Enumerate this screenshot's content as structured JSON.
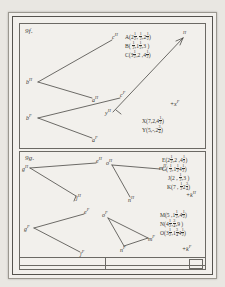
{
  "page": {
    "kind": "scanned-worksheet",
    "ink_color": "#3f3e3a",
    "paper_color": "#f2f0ec"
  },
  "problems": [
    {
      "id": "9f",
      "label": "9f.",
      "vertices": [
        {
          "name": "c-H",
          "text": "c",
          "sup": "H"
        },
        {
          "name": "b-H",
          "text": "b",
          "sup": "H"
        },
        {
          "name": "a-H",
          "text": "a",
          "sup": "H"
        },
        {
          "name": "c-F",
          "text": "c",
          "sup": "F"
        },
        {
          "name": "b-F",
          "text": "b",
          "sup": "F"
        },
        {
          "name": "a-F",
          "text": "a",
          "sup": "F"
        },
        {
          "name": "y-axis-label",
          "text": "y",
          "sup": "H"
        },
        {
          "name": "arrow-head-label",
          "text": "",
          "sup": "H"
        }
      ],
      "axis_notes": [
        {
          "name": "plus-x-f",
          "text": "+x",
          "sup": "F"
        }
      ],
      "coordinate_groups": [
        {
          "name": "abc-coords",
          "lines": [
            {
              "point": "A",
              "x": "2 1/2",
              "y": "1/2",
              "z": "2 1/2"
            },
            {
              "point": "B",
              "x": "1/2",
              "y": "1 1/2",
              "z": "3"
            },
            {
              "point": "C",
              "x": "3 1/2",
              "y": "2",
              "z": "4 1/2"
            }
          ]
        },
        {
          "name": "xy-coords",
          "lines": [
            {
              "point": "X",
              "x": "7",
              "y": "2",
              "z": "4 1/2"
            },
            {
              "point": "Y",
              "x": "5",
              "y": "-",
              "z": "2 3/4"
            }
          ]
        }
      ]
    },
    {
      "id": "9g",
      "label": "9g.",
      "vertices": [
        {
          "name": "e-H",
          "text": "e",
          "sup": "H"
        },
        {
          "name": "g-H",
          "text": "g",
          "sup": "H"
        },
        {
          "name": "j-H",
          "text": "j",
          "sup": "H"
        },
        {
          "name": "o-H",
          "text": "o",
          "sup": "H"
        },
        {
          "name": "m-H",
          "text": "m",
          "sup": "H"
        },
        {
          "name": "n-H",
          "text": "n",
          "sup": "H"
        },
        {
          "name": "e-F",
          "text": "e",
          "sup": "F"
        },
        {
          "name": "g-F",
          "text": "g",
          "sup": "F"
        },
        {
          "name": "j-F",
          "text": "j",
          "sup": "F"
        },
        {
          "name": "o-F",
          "text": "o",
          "sup": "F"
        },
        {
          "name": "m-F",
          "text": "m",
          "sup": "F"
        },
        {
          "name": "n-F",
          "text": "n",
          "sup": "F"
        }
      ],
      "axis_notes": [
        {
          "name": "plus-k-h",
          "text": "+k",
          "sup": "H"
        },
        {
          "name": "plus-k-f",
          "text": "+k",
          "sup": "F"
        }
      ],
      "coordinate_groups": [
        {
          "name": "egjk-coords",
          "lines": [
            {
              "point": "E",
              "x": "2 1/2",
              "y": "2",
              "z": "4 1/2"
            },
            {
              "point": "G",
              "x": "1/2",
              "y": "1 1/2",
              "z": "4 1/2"
            },
            {
              "point": "J",
              "x": "2",
              "y": "1/2",
              "z": "3"
            },
            {
              "point": "K",
              "x": "7",
              "y": "1/2",
              "z": "2 3/4"
            }
          ]
        },
        {
          "name": "mno-coords",
          "lines": [
            {
              "point": "M",
              "x": "5",
              "y": "1 1/2",
              "z": "4 1/2"
            },
            {
              "point": "N",
              "x": "4 1/2",
              "y": "3/4",
              "z": "9"
            },
            {
              "point": "O",
              "x": "3 1/2",
              "y": "1 3/4",
              "z": "4 1/2"
            }
          ]
        }
      ]
    }
  ],
  "footer": {
    "cells": [
      "",
      ""
    ],
    "stamp": ""
  }
}
